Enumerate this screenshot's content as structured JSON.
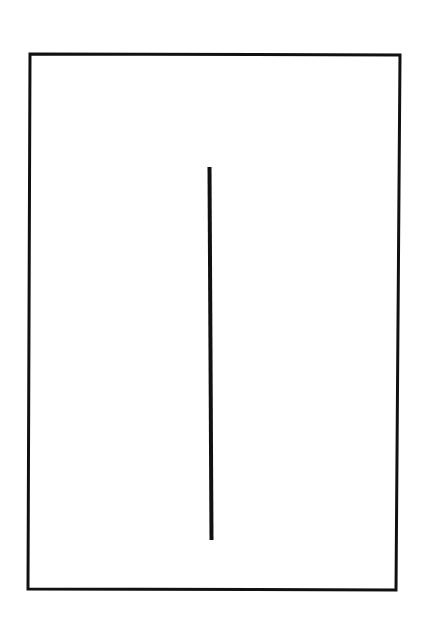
{
  "figure": {
    "background": "#ffffff",
    "stroke_color": "#111111",
    "frame": {
      "points": [
        [
          30,
          54
        ],
        [
          400,
          55
        ],
        [
          396,
          590
        ],
        [
          28,
          589
        ]
      ],
      "stroke_width": 3
    },
    "divider_line": {
      "x1": 209.5,
      "y1": 167,
      "x2": 211.5,
      "y2": 540,
      "stroke_width": 4
    }
  }
}
